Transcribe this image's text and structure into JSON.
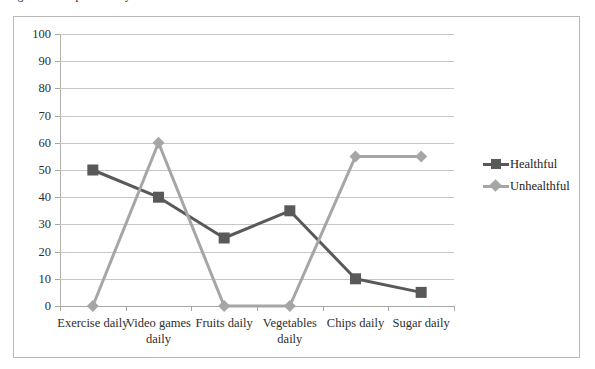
{
  "caption": {
    "text": "Figure: Self-reported daily habits"
  },
  "legend": {
    "position": "right",
    "entries": [
      {
        "label": "Healthful",
        "color": "#595959",
        "marker": "square"
      },
      {
        "label": "Unhealthful",
        "color": "#a6a6a6",
        "marker": "diamond"
      }
    ]
  },
  "chart_data": {
    "type": "line",
    "title": "",
    "xlabel": "",
    "ylabel": "",
    "ylim": [
      0,
      100
    ],
    "ytick_step": 10,
    "yticks": [
      100,
      90,
      80,
      70,
      60,
      50,
      40,
      30,
      20,
      10,
      0
    ],
    "grid": true,
    "legend_position": "right",
    "categories": [
      "Exercise daily",
      "Video games daily",
      "Fruits daily",
      "Vegetables daily",
      "Chips daily",
      "Sugar daily"
    ],
    "series": [
      {
        "name": "Healthful",
        "color": "#595959",
        "marker": "square",
        "values": [
          50,
          40,
          25,
          35,
          10,
          5
        ]
      },
      {
        "name": "Unhealthful",
        "color": "#a6a6a6",
        "marker": "diamond",
        "values": [
          0,
          60,
          0,
          0,
          55,
          55
        ]
      }
    ]
  }
}
